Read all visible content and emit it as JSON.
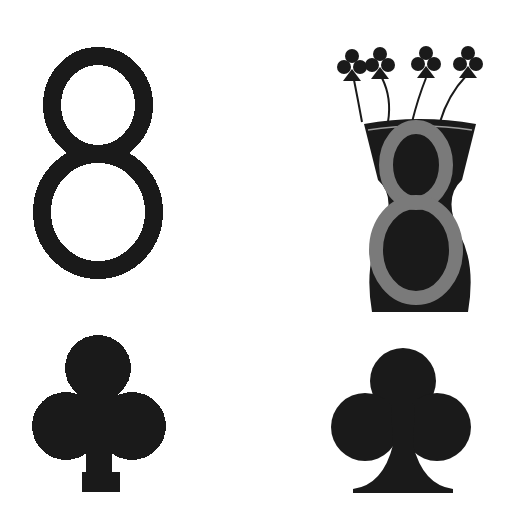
{
  "layout": "2x2 icon grid",
  "colors": {
    "background": "#ffffff",
    "ink": "#1a1a1a",
    "vase_figure": "#7a7a7a",
    "vase_rim": "#9a9a9a"
  },
  "panels": [
    {
      "position": "top-left",
      "icon": "digit-eight-pixelated",
      "glyph": "8"
    },
    {
      "position": "top-right",
      "icon": "vase-with-eight-and-club-flowers",
      "flower_count": 4
    },
    {
      "position": "bottom-left",
      "icon": "club-suit-pixelated",
      "glyph": "♣"
    },
    {
      "position": "bottom-right",
      "icon": "club-suit-smooth",
      "glyph": "♣"
    }
  ]
}
